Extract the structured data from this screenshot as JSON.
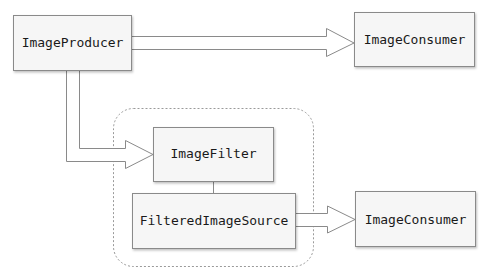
{
  "diagram": {
    "nodes": {
      "producer": {
        "label": "ImageProducer"
      },
      "consumer_top": {
        "label": "ImageConsumer"
      },
      "filter": {
        "label": "ImageFilter"
      },
      "filtered_source": {
        "label": "FilteredImageSource"
      },
      "consumer_bottom": {
        "label": "ImageConsumer"
      }
    },
    "edges": [
      {
        "from": "ImageProducer",
        "to": "ImageConsumer",
        "style": "hollow-arrow"
      },
      {
        "from": "ImageProducer",
        "to": "ImageFilter",
        "style": "hollow-arrow"
      },
      {
        "from": "ImageFilter",
        "to": "FilteredImageSource",
        "style": "line"
      },
      {
        "from": "FilteredImageSource",
        "to": "ImageConsumer",
        "style": "hollow-arrow"
      }
    ],
    "group": {
      "members": [
        "ImageFilter",
        "FilteredImageSource"
      ],
      "style": "dashed-rounded"
    },
    "colors": {
      "box_fill": "#f6f6f6",
      "box_stroke": "#8a8a8a",
      "arrow_stroke": "#8a8a8a",
      "group_stroke": "#9a9a9a"
    }
  }
}
